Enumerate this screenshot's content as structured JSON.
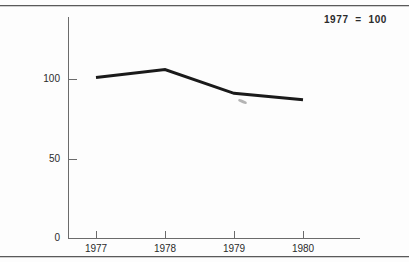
{
  "annotation": "1977  =  100",
  "axis": {
    "y_ticks": [
      {
        "label": "100",
        "value": 100
      },
      {
        "label": "50",
        "value": 50
      },
      {
        "label": "0",
        "value": 0
      }
    ],
    "x_ticks": [
      "1977",
      "1978",
      "1979",
      "1980"
    ]
  },
  "chart_data": {
    "type": "line",
    "title": "",
    "subtitle": "",
    "annotations": [
      "1977 = 100"
    ],
    "xlabel": "",
    "ylabel": "",
    "categories": [
      "1977",
      "1978",
      "1979",
      "1980"
    ],
    "values": [
      101,
      106,
      91,
      87
    ],
    "series": [
      {
        "name": "index",
        "values": [
          101,
          106,
          91,
          87
        ]
      }
    ],
    "ylim": [
      0,
      140
    ],
    "yticks": [
      0,
      50,
      100
    ],
    "ytick_labels": [
      "0",
      "50",
      "100"
    ],
    "xtick_labels": [
      "1977",
      "1978",
      "1979",
      "1980"
    ],
    "grid": false,
    "legend": null,
    "line_color": "#1a1a1a",
    "line_width": 3,
    "markers": false
  }
}
